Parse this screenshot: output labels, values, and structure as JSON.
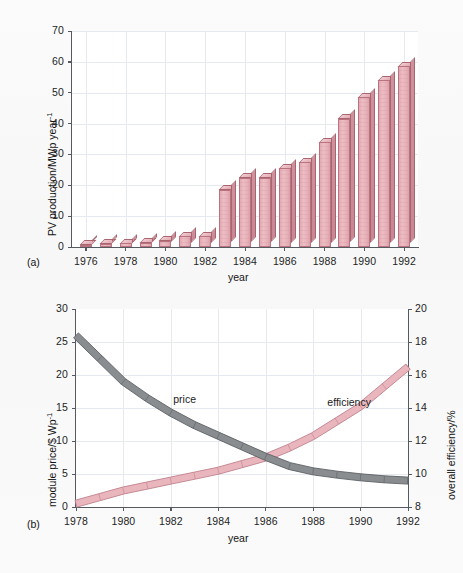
{
  "figure": {
    "panels": [
      {
        "tag": "(a)",
        "xlabel": "year",
        "ylabel_main": "PV production/MWp year",
        "ylabel_sup": "-1"
      },
      {
        "tag": "(b)",
        "xlabel": "year",
        "ylabel_left_main": "module price/$ Wp",
        "ylabel_left_sup": "-1",
        "ylabel_right": "overall efficiency/%"
      }
    ],
    "colors": {
      "bar_fill": "#e7b2ba",
      "bar_edge": "#b9737f",
      "bar_side": "#c88792",
      "price_curve": "#8a8d90",
      "price_curve_edge": "#5d6165",
      "efficiency_curve": "#eab6bd",
      "efficiency_curve_edge": "#c0818c",
      "grid": "#e6e9ef",
      "axis": "#555a60",
      "background": "#fbfbfb"
    }
  },
  "chart_data": [
    {
      "type": "bar",
      "title": "",
      "xlabel": "year",
      "ylabel": "PV production/MWp year^-1",
      "xlim": [
        1975.3,
        1992.7
      ],
      "ylim": [
        0,
        70
      ],
      "yticks": [
        0,
        10,
        20,
        30,
        40,
        50,
        60,
        70
      ],
      "xticks": [
        1976,
        1978,
        1980,
        1982,
        1984,
        1986,
        1988,
        1990,
        1992
      ],
      "xtick_labels": [
        "1976",
        "1978",
        "1980",
        "1982",
        "1984",
        "1986",
        "1988",
        "1990",
        "1992"
      ],
      "ytick_labels": [
        "0",
        "10",
        "20",
        "30",
        "40",
        "50",
        "60",
        "70"
      ],
      "grid": true,
      "categories": [
        1976,
        1977,
        1978,
        1979,
        1980,
        1981,
        1982,
        1983,
        1984,
        1985,
        1986,
        1987,
        1988,
        1989,
        1990,
        1991,
        1992
      ],
      "values": [
        0.8,
        1.0,
        1.2,
        1.4,
        2.0,
        3.5,
        3.5,
        18.5,
        22.5,
        22.5,
        25.5,
        27.5,
        34.0,
        41.5,
        48.5,
        54.0,
        58.5
      ]
    },
    {
      "type": "line",
      "title": "",
      "xlabel": "year",
      "ylabel": "module price/$ Wp^-1",
      "ylabel_secondary": "overall efficiency/%",
      "xlim": [
        1978,
        1992
      ],
      "ylim": [
        0,
        30
      ],
      "ylim_secondary": [
        8,
        20
      ],
      "yticks": [
        0,
        5,
        10,
        15,
        20,
        25,
        30
      ],
      "ytick_labels": [
        "0",
        "5",
        "10",
        "15",
        "20",
        "25",
        "30"
      ],
      "yticks_secondary": [
        8,
        10,
        12,
        14,
        16,
        18,
        20
      ],
      "ytick_labels_secondary": [
        "8",
        "10",
        "12",
        "14",
        "16",
        "18",
        "20"
      ],
      "xticks": [
        1978,
        1980,
        1982,
        1984,
        1986,
        1988,
        1990,
        1992
      ],
      "xtick_labels": [
        "1978",
        "1980",
        "1982",
        "1984",
        "1986",
        "1988",
        "1990",
        "1992"
      ],
      "grid": true,
      "x": [
        1978,
        1979,
        1980,
        1981,
        1982,
        1983,
        1984,
        1985,
        1986,
        1987,
        1988,
        1989,
        1990,
        1991,
        1992
      ],
      "series": [
        {
          "name": "price",
          "axis": "left",
          "unit": "$ Wp^-1",
          "values": [
            26.0,
            22.5,
            19.0,
            16.5,
            14.3,
            12.4,
            10.8,
            9.2,
            7.6,
            6.2,
            5.4,
            4.9,
            4.5,
            4.2,
            4.0
          ]
        },
        {
          "name": "efficiency",
          "axis": "right",
          "unit": "%",
          "values": [
            8.2,
            8.6,
            9.0,
            9.3,
            9.6,
            9.9,
            10.2,
            10.6,
            11.0,
            11.6,
            12.3,
            13.2,
            14.1,
            15.3,
            16.5
          ]
        }
      ],
      "annotations": [
        {
          "text": "price",
          "x": 1982.1,
          "y_left": 16.2
        },
        {
          "text": "efficiency",
          "x": 1988.6,
          "y_right": 14.3
        }
      ]
    }
  ]
}
